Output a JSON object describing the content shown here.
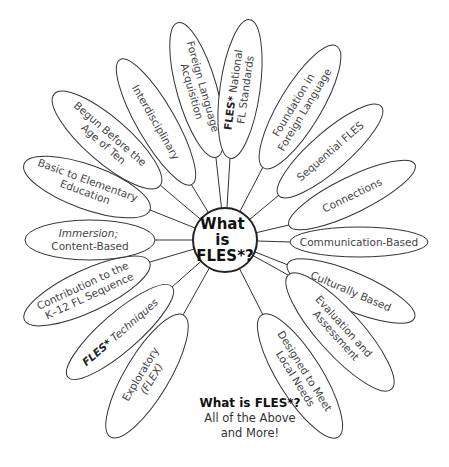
{
  "diagram": {
    "type": "flower / radial concept map",
    "hub": {
      "lines": [
        "What",
        "is",
        "FLES*?"
      ]
    },
    "petals": [
      {
        "id": "foreign-language-acquisition",
        "lines": [
          [
            "Foreign Language"
          ],
          [
            "Acquisition"
          ]
        ]
      },
      {
        "id": "fles-national-fl-standards",
        "lines": [
          [
            "FLES*",
            " National"
          ],
          [
            "FL Standards"
          ]
        ],
        "bold_prefix": "FLES*"
      },
      {
        "id": "foundation-in-foreign-language",
        "lines": [
          [
            "Foundation in"
          ],
          [
            "Foreign Language"
          ]
        ]
      },
      {
        "id": "sequential-fles",
        "lines": [
          [
            "Sequential FLES"
          ]
        ]
      },
      {
        "id": "connections",
        "lines": [
          [
            "Connections"
          ]
        ]
      },
      {
        "id": "communication-based",
        "lines": [
          [
            "Communication-Based"
          ]
        ]
      },
      {
        "id": "culturally-based",
        "lines": [
          [
            "Culturally Based"
          ]
        ]
      },
      {
        "id": "evaluation-and-assessment",
        "lines": [
          [
            "Evaluation and"
          ],
          [
            "Assessment"
          ]
        ]
      },
      {
        "id": "designed-to-meet-local-needs",
        "lines": [
          [
            "Designed to Meet"
          ],
          [
            "Local Needs"
          ]
        ]
      },
      {
        "id": "exploratory-flex",
        "lines": [
          [
            "Exploratory"
          ],
          [
            "(FLEX)"
          ]
        ]
      },
      {
        "id": "fles-techniques",
        "lines": [
          [
            "FLES*",
            " Techniques"
          ]
        ],
        "bold_prefix": "FLES*"
      },
      {
        "id": "contribution-k12",
        "lines": [
          [
            "Contribution to the"
          ],
          [
            "K–12 FL Sequence"
          ]
        ]
      },
      {
        "id": "immersion-content-based",
        "lines": [
          [
            "Immersion;"
          ],
          [
            "Content-Based"
          ]
        ],
        "italic_first_line": true
      },
      {
        "id": "basic-to-elementary-education",
        "lines": [
          [
            "Basic to Elementary"
          ],
          [
            "Education"
          ]
        ]
      },
      {
        "id": "begun-before-age-of-ten",
        "lines": [
          [
            "Begun Before the"
          ],
          [
            "Age of Ten"
          ]
        ]
      },
      {
        "id": "interdisciplinary",
        "lines": [
          [
            "Interdisciplinary"
          ]
        ]
      }
    ],
    "caption": {
      "title": "What is FLES*?",
      "line1": "All of the Above",
      "line2": "and More!"
    },
    "colors": {
      "stroke": "#333333",
      "text": "#444444",
      "background": "#ffffff"
    }
  }
}
